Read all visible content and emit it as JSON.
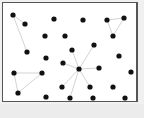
{
  "diagram": {
    "type": "network-graph",
    "node_color": "#111111",
    "edge_color": "#c8c8c8",
    "frame_border_color": "#555555",
    "nodes": [
      {
        "id": "n1",
        "x": 13,
        "y": 15
      },
      {
        "id": "n2",
        "x": 25,
        "y": 24
      },
      {
        "id": "n3",
        "x": 54,
        "y": 19
      },
      {
        "id": "n4",
        "x": 83,
        "y": 20
      },
      {
        "id": "n5",
        "x": 107,
        "y": 20
      },
      {
        "id": "n6",
        "x": 124,
        "y": 18
      },
      {
        "id": "n7",
        "x": 113,
        "y": 36
      },
      {
        "id": "n8",
        "x": 65,
        "y": 36
      },
      {
        "id": "n9",
        "x": 45,
        "y": 36
      },
      {
        "id": "n10",
        "x": 27,
        "y": 52
      },
      {
        "id": "n11",
        "x": 46,
        "y": 58
      },
      {
        "id": "n12",
        "x": 94,
        "y": 45
      },
      {
        "id": "n13",
        "x": 72,
        "y": 50
      },
      {
        "id": "n14",
        "x": 119,
        "y": 56
      },
      {
        "id": "n15",
        "x": 63,
        "y": 63
      },
      {
        "id": "n16",
        "x": 14,
        "y": 73
      },
      {
        "id": "n17",
        "x": 42,
        "y": 73
      },
      {
        "id": "n18",
        "x": 79,
        "y": 69
      },
      {
        "id": "n19",
        "x": 99,
        "y": 68
      },
      {
        "id": "n20",
        "x": 131,
        "y": 72
      },
      {
        "id": "n21",
        "x": 18,
        "y": 93
      },
      {
        "id": "n22",
        "x": 62,
        "y": 87
      },
      {
        "id": "n23",
        "x": 90,
        "y": 87
      },
      {
        "id": "n24",
        "x": 113,
        "y": 87
      },
      {
        "id": "n25",
        "x": 46,
        "y": 97
      },
      {
        "id": "n26",
        "x": 70,
        "y": 98
      },
      {
        "id": "n27",
        "x": 93,
        "y": 98
      },
      {
        "id": "n28",
        "x": 125,
        "y": 98
      },
      {
        "id": "n29",
        "x": 3,
        "y": 88
      }
    ],
    "edges": [
      [
        "n1",
        "n2"
      ],
      [
        "n1",
        "n10"
      ],
      [
        "n5",
        "n6"
      ],
      [
        "n5",
        "n7"
      ],
      [
        "n6",
        "n7"
      ],
      [
        "n18",
        "n12"
      ],
      [
        "n18",
        "n13"
      ],
      [
        "n18",
        "n19"
      ],
      [
        "n18",
        "n15"
      ],
      [
        "n18",
        "n23"
      ],
      [
        "n18",
        "n22"
      ],
      [
        "n18",
        "n26"
      ],
      [
        "n16",
        "n17"
      ],
      [
        "n16",
        "n21"
      ],
      [
        "n17",
        "n21"
      ]
    ]
  }
}
